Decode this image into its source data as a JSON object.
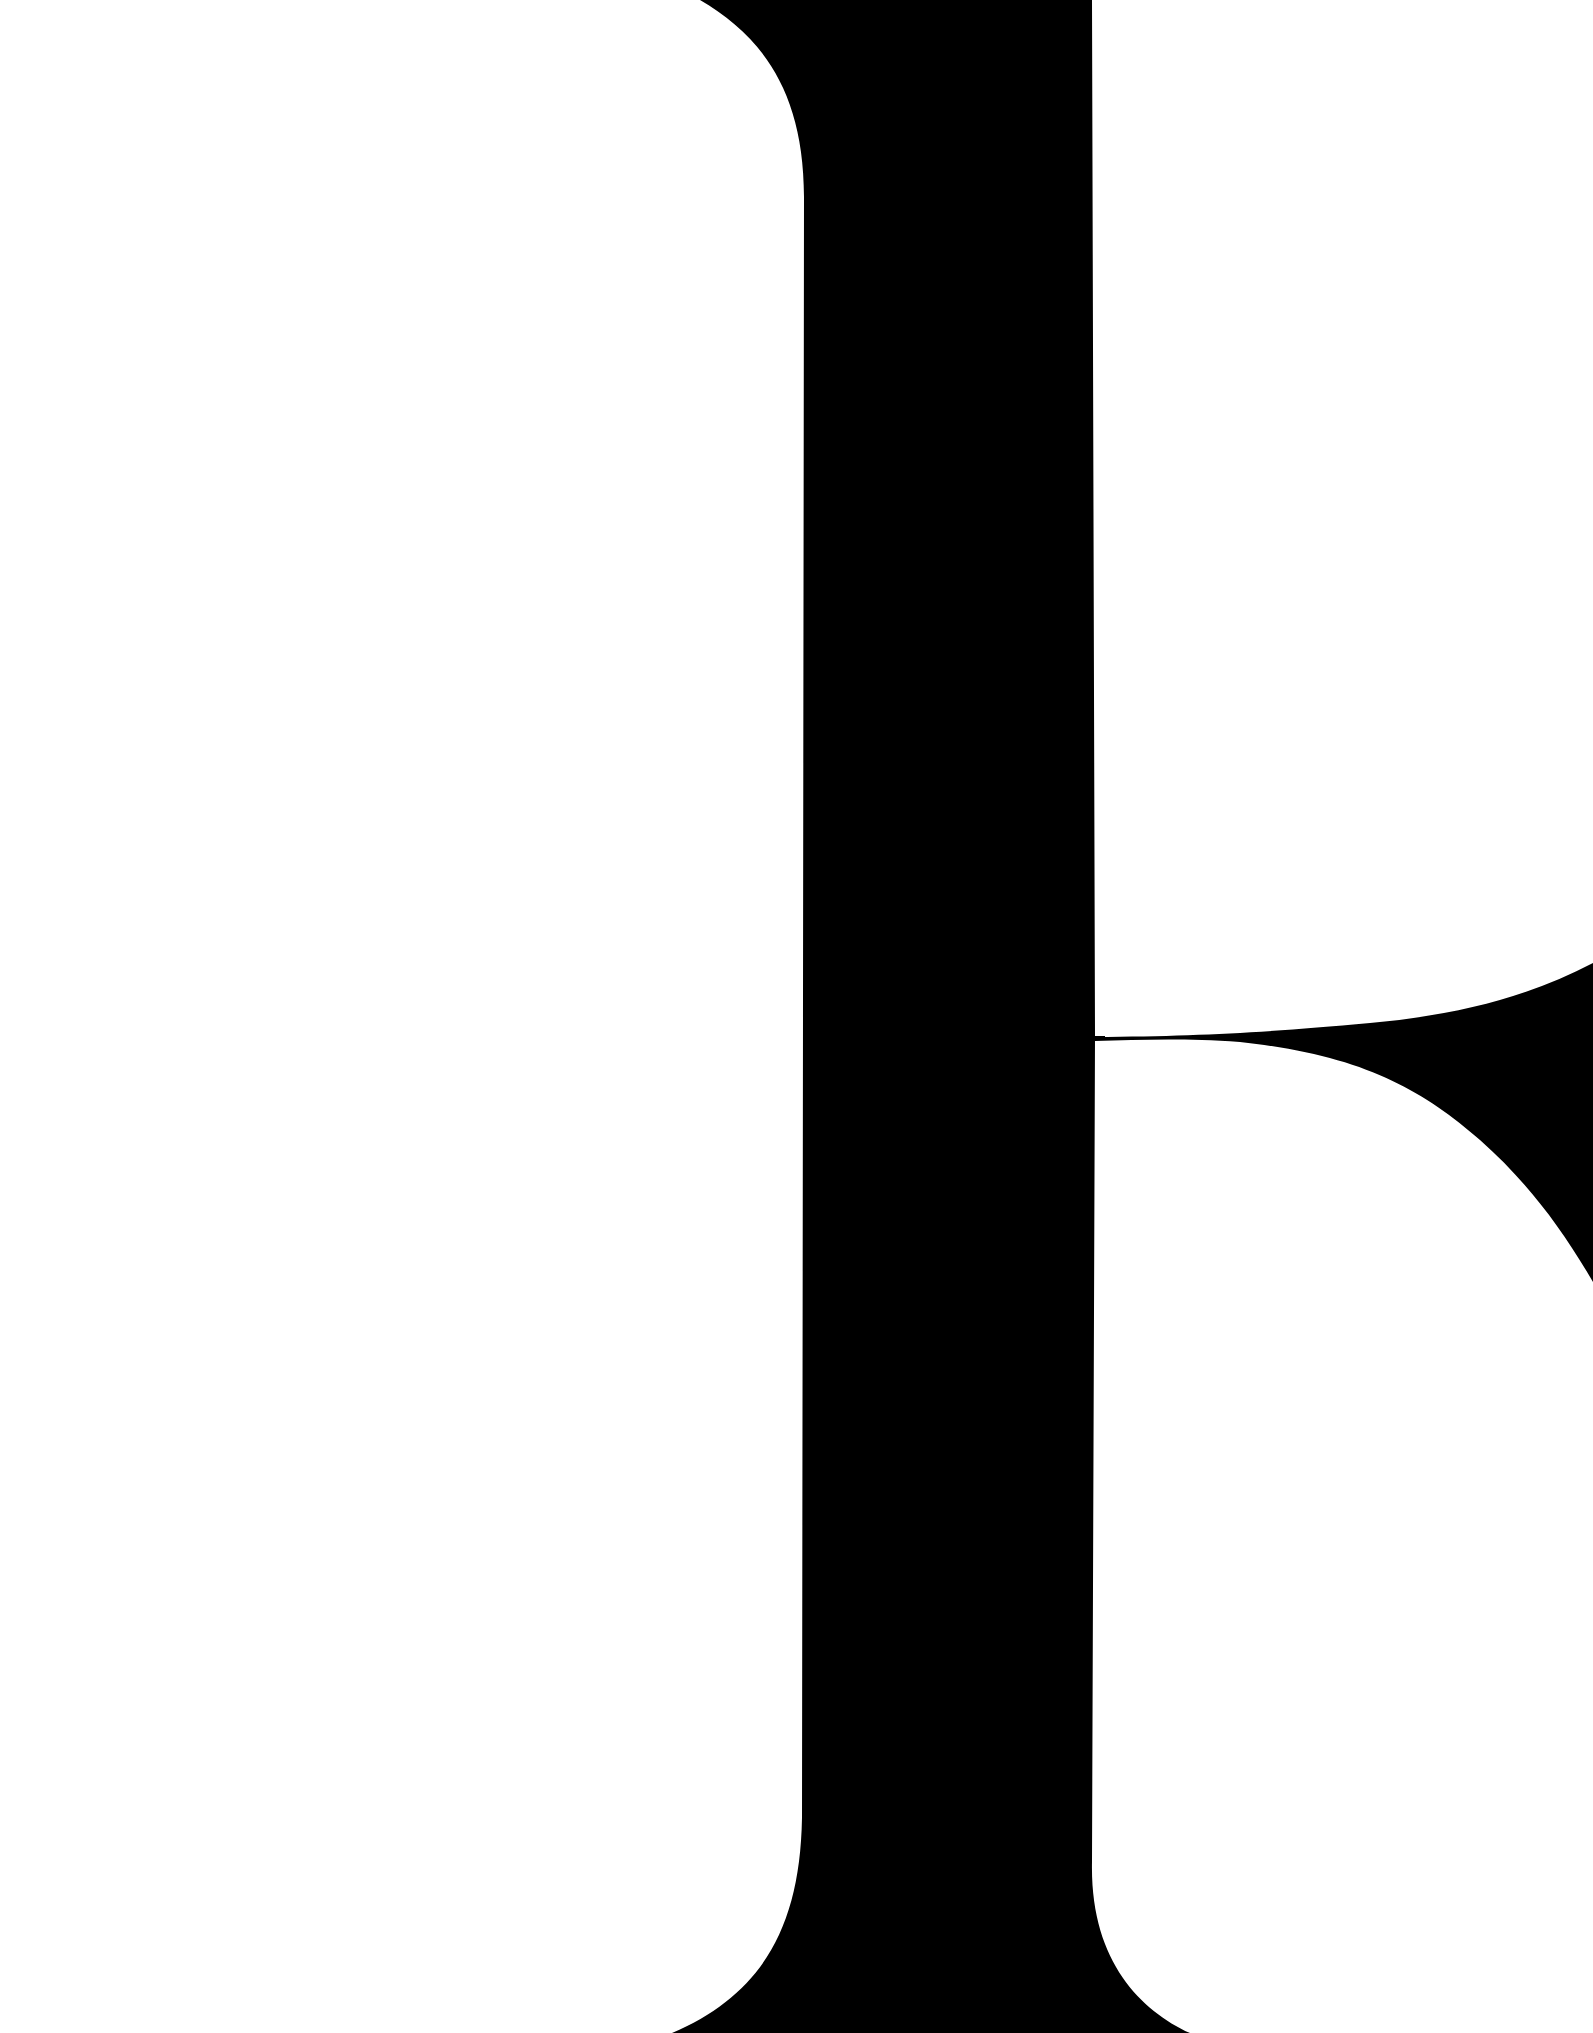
{
  "image": {
    "description": "Extreme close-up crop of a black serif letterform on white",
    "background_color": "#ffffff",
    "ink_color": "#000000",
    "shapes": [
      "vertical-stem",
      "top-left-bracket-curve",
      "bottom-serif-flare",
      "hairline-bowl-join",
      "right-bowl-and-leg-curve"
    ]
  }
}
